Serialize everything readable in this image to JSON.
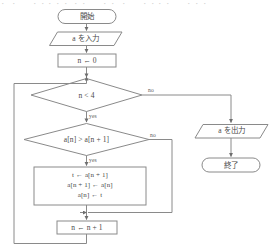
{
  "figure": {
    "type": "flowchart",
    "orientation": "top-to-bottom",
    "top_artifact_text": "・ ・ 　 ・・・・・ ・・ 　 ・・ ・ 　 ・・・・ 　 ・・・"
  },
  "nodes": {
    "start": {
      "label": "開始",
      "shape": "terminal"
    },
    "input_a": {
      "label": "a を入力",
      "shape": "parallelogram"
    },
    "init_n": {
      "label": "n ← 0",
      "shape": "process"
    },
    "cond_loop": {
      "label": "n < 4",
      "shape": "decision"
    },
    "cond_compare": {
      "label": "a[n] > a[n + 1]",
      "shape": "decision"
    },
    "swap": {
      "shape": "process",
      "lines": [
        "t ← a[n + 1]",
        "a[n + 1] ← a[n]",
        "a[n] ← t"
      ]
    },
    "increment": {
      "label": "n ← n + 1",
      "shape": "process"
    },
    "output_a": {
      "label": "a を出力",
      "shape": "parallelogram"
    },
    "end": {
      "label": "終了",
      "shape": "terminal"
    }
  },
  "edge_labels": {
    "loop_no": "no",
    "loop_yes": "yes",
    "compare_no": "no",
    "compare_yes": "yes"
  },
  "colors": {
    "stroke": "#8a8a8a",
    "text": "#4a4a4a",
    "background": "#ffffff"
  }
}
